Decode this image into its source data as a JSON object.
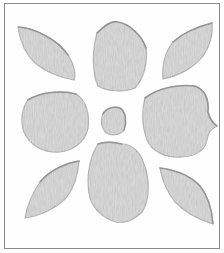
{
  "image": {
    "description": "Grayscale flower motif with eight petals around a small central bud, inside a thin rectangular frame",
    "colors": {
      "background": "#ffffff",
      "frame": "#8a8a8a",
      "petal_fill": "#c4c4c4",
      "petal_edge": "#9a9a9a"
    },
    "petals": [
      {
        "name": "top-left"
      },
      {
        "name": "top-center"
      },
      {
        "name": "top-right"
      },
      {
        "name": "middle-left"
      },
      {
        "name": "middle-right"
      },
      {
        "name": "bottom-left"
      },
      {
        "name": "bottom-center"
      },
      {
        "name": "bottom-right"
      }
    ],
    "center": {
      "name": "center-bud"
    }
  }
}
